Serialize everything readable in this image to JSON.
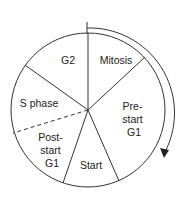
{
  "diagram": {
    "title": "",
    "type": "cell-cycle-pie",
    "colors": {
      "line": "#333333",
      "text": "#222222",
      "background": "#ffffff"
    },
    "direction": "clockwise",
    "segments": [
      {
        "id": "mitosis",
        "lines": [
          "Mitosis"
        ]
      },
      {
        "id": "prestart-g1",
        "lines": [
          "Pre-",
          "start",
          "G1"
        ]
      },
      {
        "id": "start",
        "lines": [
          "Start"
        ]
      },
      {
        "id": "poststart-g1",
        "lines": [
          "Post-",
          "start",
          "G1"
        ]
      },
      {
        "id": "s-phase",
        "lines": [
          "S phase"
        ]
      },
      {
        "id": "g2",
        "lines": [
          "G2"
        ]
      }
    ],
    "boundaries": [
      {
        "between": [
          "g2",
          "mitosis"
        ],
        "style": "solid"
      },
      {
        "between": [
          "mitosis",
          "prestart-g1"
        ],
        "style": "solid"
      },
      {
        "between": [
          "prestart-g1",
          "start"
        ],
        "style": "solid"
      },
      {
        "between": [
          "start",
          "poststart-g1"
        ],
        "style": "solid"
      },
      {
        "between": [
          "poststart-g1",
          "s-phase"
        ],
        "style": "dashed"
      },
      {
        "between": [
          "s-phase",
          "g2"
        ],
        "style": "solid"
      }
    ],
    "arrow": {
      "label": "",
      "meaning": "direction of cycle progression"
    }
  }
}
